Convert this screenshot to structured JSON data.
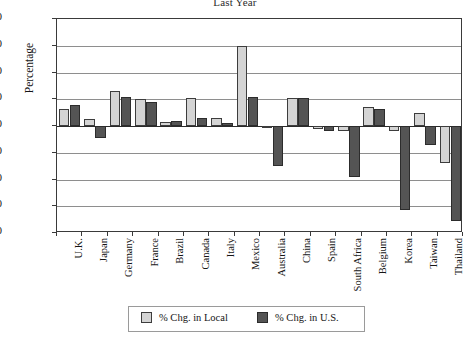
{
  "chart_data": {
    "type": "bar",
    "title": "Last Year",
    "xlabel": "",
    "ylabel": "Percentage",
    "ylim": [
      -40,
      40
    ],
    "yticks": [
      40,
      30,
      20,
      10,
      0,
      -10,
      -20,
      -30,
      -40
    ],
    "ytick_labels": [
      "40",
      "30",
      "20",
      "10",
      "0",
      "–10",
      "–20",
      "–30",
      "–40"
    ],
    "grid": true,
    "legend_position": "bottom",
    "categories": [
      "U.K.",
      "Japan",
      "Germany",
      "France",
      "Brazil",
      "Canada",
      "Italy",
      "Mexico",
      "Australia",
      "China",
      "Spain",
      "South Africa",
      "Belgium",
      "Korea",
      "Taiwan",
      "Thailand"
    ],
    "series": [
      {
        "name": "% Chg. in Local",
        "color": "#d4d4d4",
        "values": [
          6.5,
          2.5,
          13.0,
          10.0,
          1.5,
          10.5,
          3.0,
          30.0,
          -0.3,
          10.5,
          -1.0,
          -2.0,
          7.0,
          -2.0,
          5.0,
          -14.0
        ]
      },
      {
        "name": "% Chg. in U.S.",
        "color": "#545454",
        "values": [
          8.0,
          -4.5,
          11.0,
          9.0,
          1.7,
          3.0,
          1.0,
          11.0,
          -15.0,
          10.5,
          -2.0,
          -19.0,
          6.5,
          -31.5,
          -7.0,
          -35.5
        ]
      }
    ],
    "legend": [
      {
        "label": "% Chg. in Local",
        "color": "#d4d4d4"
      },
      {
        "label": "% Chg. in U.S.",
        "color": "#545454"
      }
    ]
  }
}
